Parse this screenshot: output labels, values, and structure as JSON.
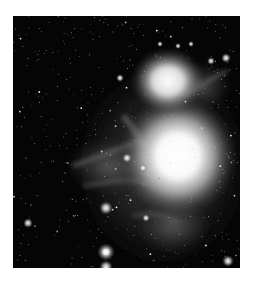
{
  "image": {
    "subject": "Orion Nebula",
    "description": "Grayscale astronomical photograph of a bright emission nebula with two bright cores surrounded by dusty filaments and a dense star field",
    "colors": {
      "background": "#ffffff",
      "sky": "#050505",
      "nebula_core": "#ffffff",
      "nebula_glow": "#9a9a9a",
      "star": "#f2f2f2"
    }
  }
}
